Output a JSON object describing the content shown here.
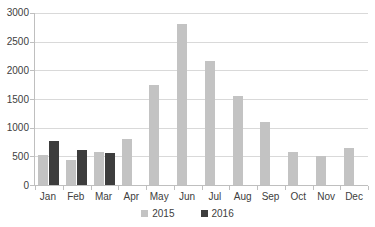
{
  "chart_data": {
    "type": "bar",
    "title": "",
    "categories": [
      "Jan",
      "Feb",
      "Mar",
      "Apr",
      "May",
      "Jun",
      "Jul",
      "Aug",
      "Sep",
      "Oct",
      "Nov",
      "Dec"
    ],
    "series": [
      {
        "name": "2015",
        "color": "#c3c3c3",
        "values": [
          520,
          440,
          580,
          800,
          1750,
          2800,
          2170,
          1560,
          1100,
          570,
          510,
          650
        ]
      },
      {
        "name": "2016",
        "color": "#3d3d3d",
        "values": [
          760,
          610,
          550,
          null,
          null,
          null,
          null,
          null,
          null,
          null,
          null,
          null
        ]
      }
    ],
    "xlabel": "",
    "ylabel": "",
    "ylim": [
      0,
      3000
    ],
    "ytick_step": 500,
    "ytick_labels": [
      "0",
      "500",
      "1000",
      "1500",
      "2000",
      "2500",
      "3000"
    ],
    "grid": true,
    "legend_position": "bottom-center"
  },
  "colors": {
    "background": "#ffffff",
    "gridline": "#d9d9d9",
    "axis_line": "#bfbfbf",
    "label_text": "#404040"
  }
}
